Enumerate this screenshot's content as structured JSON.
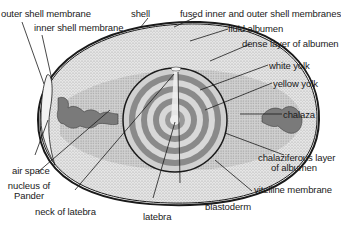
{
  "diagram": {
    "labels": {
      "outer_shell_membrane": "outer shell membrane",
      "inner_shell_membrane": "inner shell membrane",
      "shell": "shell",
      "fused_membranes": "fused inner and outer shell membranes",
      "fluid_albumen": "fluid albumen",
      "dense_albumen": "dense layer of albumen",
      "white_yolk": "white yolk",
      "yellow_yolk": "yellow yolk",
      "chalaza": "chalaza",
      "chalaziferous_line1": "chalaziferous layer",
      "chalaziferous_line2": "of albumen",
      "vitelline_membrane": "vitelline membrane",
      "blastoderm": "blastoderm",
      "latebra": "latebra",
      "neck_of_latebra": "neck of latebra",
      "nucleus_line1": "nucleus of",
      "nucleus_line2": "Pander",
      "air_space": "air space"
    },
    "colors": {
      "outline": "#1a1a1a",
      "albumen_fill": "#d9d9d9",
      "dense_albumen_fill": "#c4c4c4",
      "yolk_ring_dark": "#8a8a8a",
      "yolk_ring_light": "#d0d0d0",
      "chalaza_fill": "#7a7a7a"
    }
  }
}
